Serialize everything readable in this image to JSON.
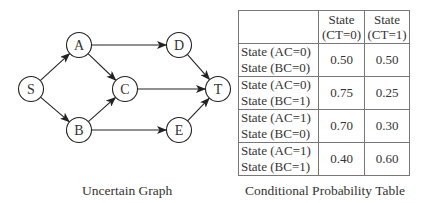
{
  "graph": {
    "caption": "Uncertain Graph",
    "nodes": [
      {
        "id": "S",
        "label": "S",
        "x": 31,
        "y": 89
      },
      {
        "id": "A",
        "label": "A",
        "x": 79,
        "y": 45
      },
      {
        "id": "B",
        "label": "B",
        "x": 79,
        "y": 130
      },
      {
        "id": "C",
        "label": "C",
        "x": 125,
        "y": 89
      },
      {
        "id": "D",
        "label": "D",
        "x": 179,
        "y": 45
      },
      {
        "id": "E",
        "label": "E",
        "x": 179,
        "y": 130
      },
      {
        "id": "T",
        "label": "T",
        "x": 218,
        "y": 89
      }
    ],
    "edges": [
      [
        "S",
        "A"
      ],
      [
        "S",
        "B"
      ],
      [
        "A",
        "C"
      ],
      [
        "B",
        "C"
      ],
      [
        "A",
        "D"
      ],
      [
        "B",
        "E"
      ],
      [
        "C",
        "T"
      ],
      [
        "D",
        "T"
      ],
      [
        "E",
        "T"
      ]
    ]
  },
  "table": {
    "caption": "Conditional Probability Table",
    "header": [
      "",
      "State\n(CT=0)",
      "State\n(CT=1)"
    ],
    "header_lines": [
      [
        "State",
        "(CT=0)"
      ],
      [
        "State",
        "(CT=1)"
      ]
    ],
    "rows": [
      {
        "cond1": "State (AC=0)",
        "cond2": "State (BC=0)",
        "p0": "0.50",
        "p1": "0.50"
      },
      {
        "cond1": "State (AC=0)",
        "cond2": "State (BC=1)",
        "p0": "0.75",
        "p1": "0.25"
      },
      {
        "cond1": "State (AC=1)",
        "cond2": "State (BC=0)",
        "p0": "0.70",
        "p1": "0.30"
      },
      {
        "cond1": "State (AC=1)",
        "cond2": "State (BC=1)",
        "p0": "0.40",
        "p1": "0.60"
      }
    ]
  }
}
